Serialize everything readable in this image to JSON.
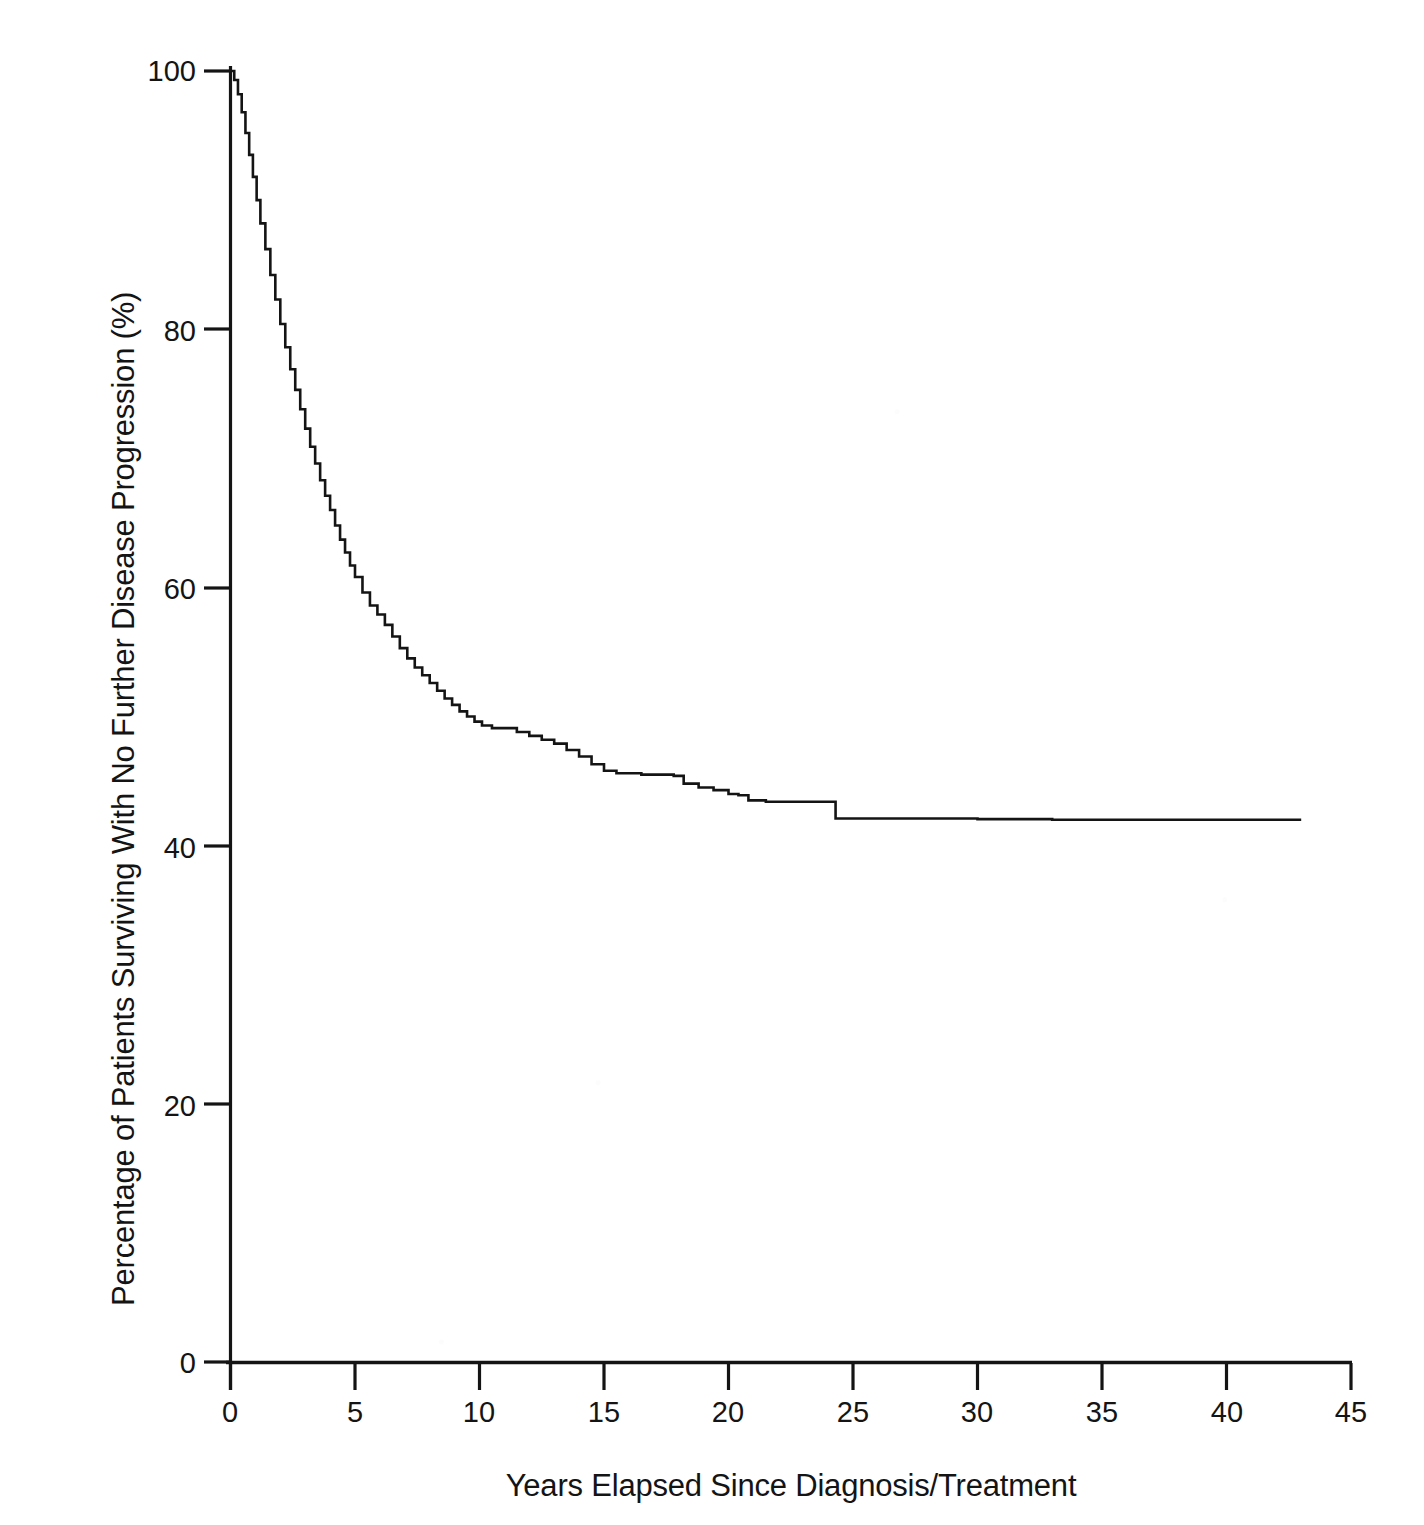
{
  "figure": {
    "background_color": "#ffffff",
    "ink_color": "#141414"
  },
  "axes": {
    "y_title": "Percentage of Patients Surviving With No Further Disease Progression (%)",
    "x_title": "Years Elapsed Since Diagnosis/Treatment",
    "y_ticks": [
      "100",
      "80",
      "60",
      "40",
      "20",
      "0"
    ],
    "x_ticks": [
      "0",
      "5",
      "10",
      "15",
      "20",
      "25",
      "30",
      "35",
      "40",
      "45"
    ]
  },
  "chart_data": {
    "type": "line",
    "title": "",
    "subtitle": "",
    "xlabel": "Years Elapsed Since Diagnosis/Treatment",
    "ylabel": "Percentage of Patients Surviving With No Further Disease Progression (%)",
    "xlim": [
      0,
      45
    ],
    "ylim": [
      0,
      100
    ],
    "x_tick_values": [
      0,
      5,
      10,
      15,
      20,
      25,
      30,
      35,
      40,
      45
    ],
    "y_tick_values": [
      0,
      20,
      40,
      60,
      80,
      100
    ],
    "grid": false,
    "legend": null,
    "annotations": [],
    "series": [
      {
        "name": "Progression-free survival",
        "style": "kaplan-meier step curve",
        "color": "#141414",
        "line_width": 2.4,
        "x": [
          0,
          0.15,
          0.3,
          0.45,
          0.6,
          0.75,
          0.9,
          1.05,
          1.2,
          1.4,
          1.6,
          1.8,
          2.0,
          2.2,
          2.4,
          2.6,
          2.8,
          3.0,
          3.2,
          3.4,
          3.6,
          3.8,
          4.0,
          4.2,
          4.4,
          4.6,
          4.8,
          5.0,
          5.3,
          5.6,
          5.9,
          6.2,
          6.5,
          6.8,
          7.1,
          7.4,
          7.7,
          8.0,
          8.3,
          8.6,
          8.9,
          9.2,
          9.5,
          9.8,
          10.1,
          10.5,
          11.0,
          11.5,
          12.0,
          12.5,
          13.0,
          13.5,
          14.0,
          14.5,
          15.0,
          15.5,
          16.0,
          16.5,
          17.0,
          17.4,
          17.8,
          18.2,
          18.8,
          19.4,
          20.0,
          20.4,
          20.8,
          21.5,
          22.5,
          23.5,
          24.1,
          24.3,
          26.0,
          28.0,
          30.0,
          33.0,
          36.0,
          39.0,
          41.0,
          43.0
        ],
        "y": [
          100,
          99.3,
          98.2,
          96.8,
          95.2,
          93.5,
          91.8,
          90.0,
          88.2,
          86.2,
          84.2,
          82.3,
          80.4,
          78.6,
          76.9,
          75.3,
          73.8,
          72.3,
          70.9,
          69.6,
          68.3,
          67.1,
          66.0,
          64.8,
          63.7,
          62.7,
          61.7,
          60.8,
          59.6,
          58.6,
          57.9,
          57.1,
          56.2,
          55.3,
          54.5,
          53.8,
          53.2,
          52.6,
          52.0,
          51.4,
          50.9,
          50.4,
          50.0,
          49.6,
          49.3,
          49.1,
          49.1,
          48.8,
          48.5,
          48.2,
          47.9,
          47.4,
          46.9,
          46.3,
          45.8,
          45.6,
          45.6,
          45.5,
          45.5,
          45.5,
          45.4,
          44.8,
          44.5,
          44.3,
          44.0,
          43.9,
          43.5,
          43.4,
          43.4,
          43.4,
          43.4,
          42.1,
          42.1,
          42.1,
          42.05,
          42.0,
          42.0,
          42.0,
          42.0,
          42.0
        ],
        "key_points": [
          {
            "x": 0,
            "y": 100.0
          },
          {
            "x": 1,
            "y": 89.2
          },
          {
            "x": 2,
            "y": 80.4
          },
          {
            "x": 3,
            "y": 72.3
          },
          {
            "x": 4,
            "y": 66.0
          },
          {
            "x": 5,
            "y": 60.8
          },
          {
            "x": 10,
            "y": 49.3
          },
          {
            "x": 15,
            "y": 45.8
          },
          {
            "x": 20,
            "y": 44.3
          },
          {
            "x": 25,
            "y": 42.1
          },
          {
            "x": 30,
            "y": 42.1
          },
          {
            "x": 35,
            "y": 42.0
          },
          {
            "x": 40,
            "y": 42.0
          },
          {
            "x": 43,
            "y": 42.0
          }
        ]
      }
    ]
  }
}
